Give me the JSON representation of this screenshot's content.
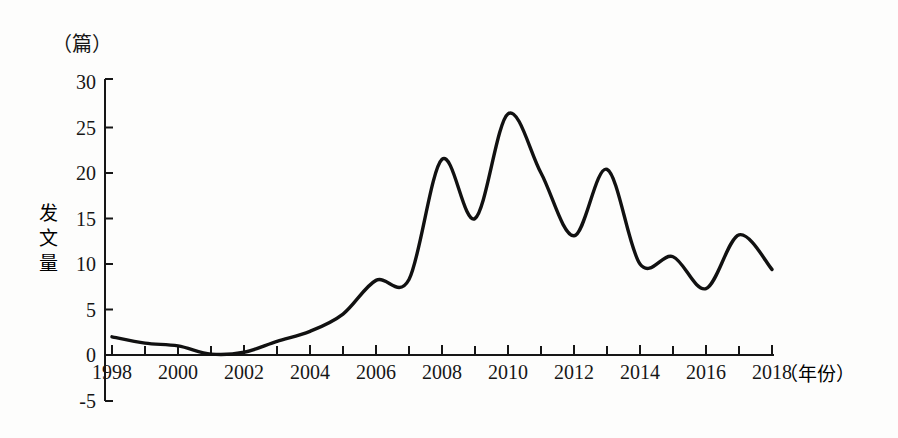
{
  "chart_data": {
    "type": "line",
    "title": "",
    "subtitle": "",
    "xlabel": "（年份）",
    "ylabel": "发文量",
    "y_unit_label": "（篇）",
    "x": [
      1998,
      1999,
      2000,
      2001,
      2002,
      2003,
      2004,
      2005,
      2006,
      2007,
      2008,
      2009,
      2010,
      2011,
      2012,
      2013,
      2014,
      2015,
      2016,
      2017,
      2018
    ],
    "values": [
      2.0,
      1.3,
      1.0,
      0.1,
      0.3,
      1.5,
      2.6,
      4.5,
      8.2,
      8.3,
      21.5,
      15.0,
      26.5,
      20.0,
      13.1,
      20.4,
      10.0,
      10.8,
      7.3,
      13.2,
      9.4
    ],
    "series": [
      {
        "name": "发文量",
        "values": [
          2.0,
          1.3,
          1.0,
          0.1,
          0.3,
          1.5,
          2.6,
          4.5,
          8.2,
          8.3,
          21.5,
          15.0,
          26.5,
          20.0,
          13.1,
          20.4,
          10.0,
          10.8,
          7.3,
          13.2,
          9.4
        ]
      }
    ],
    "xlim": [
      1998,
      2018
    ],
    "ylim": [
      -5,
      30
    ],
    "x_tick_labels": [
      "1998",
      "2000",
      "2002",
      "2004",
      "2006",
      "2008",
      "2010",
      "2012",
      "2014",
      "2016",
      "2018"
    ],
    "x_tick_values": [
      1998,
      2000,
      2002,
      2004,
      2006,
      2008,
      2010,
      2012,
      2014,
      2016,
      2018
    ],
    "x_minor_tick_values": [
      1999,
      2001,
      2003,
      2005,
      2007,
      2009,
      2011,
      2013,
      2015,
      2017
    ],
    "y_tick_labels": [
      "30",
      "25",
      "20",
      "15",
      "10",
      "5",
      "0",
      "-5"
    ],
    "y_tick_values": [
      30,
      25,
      20,
      15,
      10,
      5,
      0,
      -5
    ],
    "grid": false,
    "legend": false,
    "legend_position": "none",
    "line_color": "#111111",
    "background_color": "#fdfdfc"
  },
  "axis": {
    "y_unit": "（篇）",
    "y_title": "发文量",
    "y_title_chars": [
      "发",
      "文",
      "量"
    ],
    "x_title": "（年份）"
  },
  "y_ticks": [
    {
      "label": "30",
      "value": 30
    },
    {
      "label": "25",
      "value": 25
    },
    {
      "label": "20",
      "value": 20
    },
    {
      "label": "15",
      "value": 15
    },
    {
      "label": "10",
      "value": 10
    },
    {
      "label": "5",
      "value": 5
    },
    {
      "label": "0",
      "value": 0
    },
    {
      "label": "-5",
      "value": -5
    }
  ],
  "x_ticks": [
    {
      "label": "1998",
      "value": 1998
    },
    {
      "label": "2000",
      "value": 2000
    },
    {
      "label": "2002",
      "value": 2002
    },
    {
      "label": "2004",
      "value": 2004
    },
    {
      "label": "2006",
      "value": 2006
    },
    {
      "label": "2008",
      "value": 2008
    },
    {
      "label": "2010",
      "value": 2010
    },
    {
      "label": "2012",
      "value": 2012
    },
    {
      "label": "2014",
      "value": 2014
    },
    {
      "label": "2016",
      "value": 2016
    },
    {
      "label": "2018",
      "value": 2018
    }
  ]
}
